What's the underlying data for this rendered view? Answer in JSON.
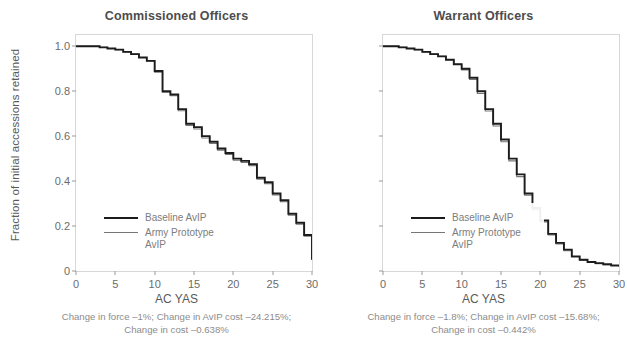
{
  "figure": {
    "ylabel": "Fraction of initial accessions retained"
  },
  "panels": [
    {
      "title": "Commissioned Officers",
      "xlabel": "AC YAS",
      "caption_line1": "Change in force –1%; Change in AvIP cost –24.215%;",
      "caption_line2": "Change in cost –0.638%",
      "legend": [
        {
          "label": "Baseline AvIP"
        },
        {
          "label": "Army Prototype AvIP"
        }
      ]
    },
    {
      "title": "Warrant Officers",
      "xlabel": "AC YAS",
      "caption_line1": "Change in force –1.8%; Change in AvIP cost –15.68%;",
      "caption_line2": "Change in cost –0.442%",
      "legend": [
        {
          "label": "Baseline AvIP"
        },
        {
          "label": "Army Prototype AvIP"
        }
      ]
    }
  ],
  "chart_data": {
    "type": "line",
    "xlabel": "AC YAS",
    "ylabel": "Fraction of initial accessions retained",
    "xlim": [
      0,
      30
    ],
    "ylim": [
      0,
      1.05
    ],
    "xticks": [
      0,
      5,
      10,
      15,
      20,
      25,
      30
    ],
    "yticks": [
      0,
      0.2,
      0.4,
      0.6,
      0.8,
      1.0
    ],
    "ytick_labels": [
      "0",
      "0.2",
      "0.4",
      "0.6",
      "0.8",
      "1.0"
    ],
    "grid": false,
    "legend_position": "lower-left",
    "colors": {
      "baseline": "#1c1c1c",
      "prototype": "#767676"
    },
    "panels": [
      {
        "name": "Commissioned Officers",
        "x": [
          0,
          1,
          2,
          3,
          4,
          5,
          6,
          7,
          8,
          9,
          10,
          11,
          12,
          13,
          14,
          15,
          16,
          17,
          18,
          19,
          20,
          21,
          22,
          23,
          24,
          25,
          26,
          27,
          28,
          29,
          30
        ],
        "series": [
          {
            "name": "Baseline AvIP",
            "values": [
              1.0,
              1.0,
              1.0,
              0.995,
              0.99,
              0.985,
              0.975,
              0.965,
              0.95,
              0.935,
              0.89,
              0.8,
              0.785,
              0.72,
              0.655,
              0.64,
              0.6,
              0.575,
              0.545,
              0.525,
              0.5,
              0.49,
              0.475,
              0.415,
              0.395,
              0.345,
              0.315,
              0.255,
              0.215,
              0.16,
              0.05
            ]
          },
          {
            "name": "Army Prototype AvIP",
            "values": [
              1.0,
              1.0,
              1.0,
              0.995,
              0.99,
              0.985,
              0.975,
              0.965,
              0.95,
              0.935,
              0.885,
              0.795,
              0.78,
              0.713,
              0.648,
              0.632,
              0.592,
              0.567,
              0.538,
              0.518,
              0.493,
              0.483,
              0.468,
              0.408,
              0.388,
              0.338,
              0.308,
              0.248,
              0.208,
              0.155,
              0.05
            ]
          }
        ]
      },
      {
        "name": "Warrant Officers",
        "x": [
          0,
          1,
          2,
          3,
          4,
          5,
          6,
          7,
          8,
          9,
          10,
          11,
          12,
          13,
          14,
          15,
          16,
          17,
          18,
          19,
          20,
          21,
          22,
          23,
          24,
          25,
          26,
          27,
          28,
          29,
          30
        ],
        "series": [
          {
            "name": "Baseline AvIP",
            "values": [
              1.0,
              1.0,
              0.995,
              0.99,
              0.985,
              0.975,
              0.965,
              0.955,
              0.94,
              0.92,
              0.9,
              0.86,
              0.8,
              0.72,
              0.655,
              0.585,
              0.5,
              0.43,
              0.345,
              0.28,
              0.225,
              0.165,
              0.125,
              0.095,
              0.065,
              0.05,
              0.04,
              0.035,
              0.03,
              0.025,
              0.02
            ]
          },
          {
            "name": "Army Prototype AvIP",
            "values": [
              1.0,
              1.0,
              0.995,
              0.99,
              0.985,
              0.975,
              0.965,
              0.955,
              0.94,
              0.92,
              0.895,
              0.852,
              0.79,
              0.712,
              0.645,
              0.575,
              0.49,
              0.42,
              0.337,
              0.272,
              0.218,
              0.16,
              0.12,
              0.09,
              0.062,
              0.048,
              0.038,
              0.033,
              0.028,
              0.023,
              0.02
            ]
          }
        ]
      }
    ]
  }
}
